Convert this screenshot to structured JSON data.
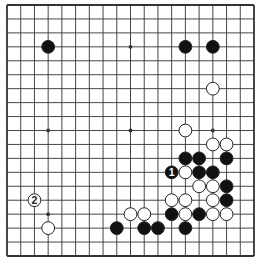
{
  "diagram": {
    "type": "go-board",
    "size": 19,
    "colors": {
      "background": "#ffffff",
      "line": "#333333",
      "black": "#111111",
      "white": "#ffffff",
      "stone_outline": "#222222"
    },
    "star_points": [
      [
        3,
        3
      ],
      [
        9,
        3
      ],
      [
        15,
        3
      ],
      [
        3,
        9
      ],
      [
        9,
        9
      ],
      [
        15,
        9
      ],
      [
        3,
        15
      ],
      [
        9,
        15
      ],
      [
        15,
        15
      ]
    ],
    "black_stones": [
      {
        "col": 3,
        "row": 3
      },
      {
        "col": 13,
        "row": 3
      },
      {
        "col": 15,
        "row": 3
      },
      {
        "col": 13,
        "row": 11
      },
      {
        "col": 14,
        "row": 11
      },
      {
        "col": 16,
        "row": 11
      },
      {
        "col": 12,
        "row": 12,
        "label": "1"
      },
      {
        "col": 14,
        "row": 12
      },
      {
        "col": 15,
        "row": 12
      },
      {
        "col": 16,
        "row": 13
      },
      {
        "col": 16,
        "row": 14
      },
      {
        "col": 12,
        "row": 15
      },
      {
        "col": 14,
        "row": 15
      },
      {
        "col": 8,
        "row": 16
      },
      {
        "col": 10,
        "row": 16
      },
      {
        "col": 11,
        "row": 16
      },
      {
        "col": 13,
        "row": 16
      }
    ],
    "white_stones": [
      {
        "col": 15,
        "row": 6
      },
      {
        "col": 13,
        "row": 9
      },
      {
        "col": 15,
        "row": 10
      },
      {
        "col": 16,
        "row": 10
      },
      {
        "col": 13,
        "row": 12
      },
      {
        "col": 14,
        "row": 13
      },
      {
        "col": 15,
        "row": 13
      },
      {
        "col": 2,
        "row": 14,
        "label": "2"
      },
      {
        "col": 12,
        "row": 14
      },
      {
        "col": 13,
        "row": 14
      },
      {
        "col": 15,
        "row": 14
      },
      {
        "col": 9,
        "row": 15
      },
      {
        "col": 10,
        "row": 15
      },
      {
        "col": 13,
        "row": 15
      },
      {
        "col": 15,
        "row": 15
      },
      {
        "col": 16,
        "row": 15
      },
      {
        "col": 3,
        "row": 16
      }
    ],
    "move_labels": [
      {
        "number": "1",
        "color": "black",
        "col": 12,
        "row": 12
      },
      {
        "number": "2",
        "color": "white",
        "col": 2,
        "row": 14
      }
    ]
  }
}
